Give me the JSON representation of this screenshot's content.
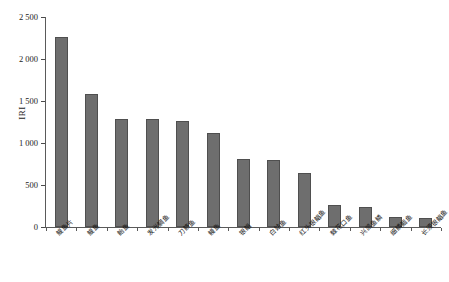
{
  "chart_data": {
    "type": "bar",
    "title": "",
    "xlabel": "",
    "ylabel": "IRI",
    "ylim": [
      0,
      2500
    ],
    "yticks": [
      0,
      500,
      1000,
      1500,
      2000,
      2500
    ],
    "ytick_labels": [
      "0",
      "500",
      "1 000",
      "1 500",
      "2 000",
      "2 500"
    ],
    "grid": false,
    "legend": "none",
    "bar_color": "#6e6e6e",
    "bar_edge_color": "#4f4f4f",
    "axis_color": "#5a5a5a",
    "categories": [
      "鳀鱼片",
      "鳀鱼",
      "鲐鱼",
      "发光鲷鱼",
      "刀鲚鱼",
      "鳗鱼",
      "银鲳",
      "白姑鱼",
      "红头银鲳鱼",
      "棘花口鱼",
      "兴凯鱼鳞",
      "细鳞鲴鱼",
      "长须银鲳鱼"
    ],
    "values": [
      2260,
      1585,
      1285,
      1280,
      1265,
      1125,
      815,
      800,
      645,
      265,
      240,
      120,
      110
    ]
  },
  "axis": {
    "y_title": "IRI"
  }
}
